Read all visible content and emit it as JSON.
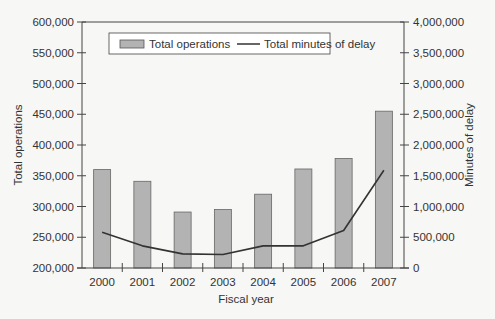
{
  "chart_data": {
    "type": "bar",
    "title": "",
    "xlabel": "Fiscal year",
    "ylabel": "Total operations",
    "y2label": "Minutes of delay",
    "categories": [
      "2000",
      "2001",
      "2002",
      "2003",
      "2004",
      "2005",
      "2006",
      "2007"
    ],
    "series": [
      {
        "name": "Total operations",
        "type": "bar",
        "axis": "left",
        "color": "#b3b3b3",
        "values": [
          360000,
          341000,
          291000,
          295000,
          320000,
          361000,
          378000,
          455000
        ]
      },
      {
        "name": "Total minutes of delay",
        "type": "line",
        "axis": "right",
        "color": "#333333",
        "values": [
          580000,
          360000,
          230000,
          220000,
          360000,
          360000,
          610000,
          1590000
        ]
      }
    ],
    "ylim": [
      200000,
      600000
    ],
    "y2lim": [
      0,
      4000000
    ],
    "yticks": [
      "200,000",
      "250,000",
      "300,000",
      "350,000",
      "400,000",
      "450,000",
      "500,000",
      "550,000",
      "600,000"
    ],
    "y2ticks": [
      "0",
      "500,000",
      "1,000,000",
      "1,500,000",
      "2,000,000",
      "2,500,000",
      "3,000,000",
      "3,500,000",
      "4,000,000"
    ],
    "grid": false,
    "legend_position": "top-inside"
  },
  "legend": {
    "bar_label": "Total operations",
    "line_label": "Total minutes of delay"
  },
  "axes": {
    "xlabel": "Fiscal year",
    "ylabel": "Total operations",
    "y2label": "Minutes of delay"
  }
}
